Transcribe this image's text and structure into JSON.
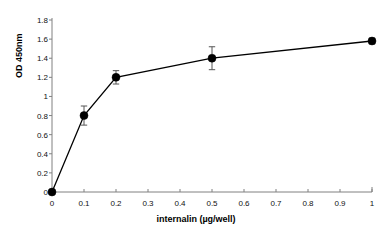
{
  "chart_data": {
    "type": "line",
    "title": "",
    "subtitle": "",
    "xlabel": "internalin (µg/well)",
    "ylabel": "OD 450nm",
    "xlim": [
      0,
      1
    ],
    "ylim": [
      0,
      1.8
    ],
    "grid": false,
    "legend": false,
    "legend_position": "none",
    "marker": "filled-circle",
    "line_color": "#000000",
    "marker_color": "#000000",
    "error_bar_color": "#555555",
    "axis_color": "#808080",
    "background_color": "#ffffff",
    "xticks": [
      0,
      0.1,
      0.2,
      0.3,
      0.4,
      0.5,
      0.6,
      0.7,
      0.8,
      0.9,
      1
    ],
    "xtick_labels": [
      "0",
      "0.1",
      "0.2",
      "0.3",
      "0.4",
      "0.5",
      "0.6",
      "0.7",
      "0.8",
      "0.9",
      "1"
    ],
    "yticks": [
      0,
      0.2,
      0.4,
      0.6,
      0.8,
      1,
      1.2,
      1.4,
      1.6,
      1.8
    ],
    "ytick_labels": [
      "0",
      "0.2",
      "0.4",
      "0.6",
      "0.8",
      "1",
      "1.2",
      "1.4",
      "1.6",
      "1.8"
    ],
    "x": [
      0,
      0.1,
      0.2,
      0.5,
      1
    ],
    "values": [
      0,
      0.8,
      1.2,
      1.4,
      1.58
    ],
    "yerr": [
      0,
      0.1,
      0.07,
      0.12,
      0.03
    ],
    "series": [
      {
        "name": "OD 450nm",
        "x": [
          0,
          0.1,
          0.2,
          0.5,
          1
        ],
        "values": [
          0,
          0.8,
          1.2,
          1.4,
          1.58
        ],
        "yerr": [
          0,
          0.1,
          0.07,
          0.12,
          0.03
        ]
      }
    ],
    "points": [
      {
        "x": 0,
        "y": 0,
        "yerr": 0,
        "xlabel": "0"
      },
      {
        "x": 0.1,
        "y": 0.8,
        "yerr": 0.1,
        "xlabel": "0.1"
      },
      {
        "x": 0.2,
        "y": 1.2,
        "yerr": 0.07,
        "xlabel": "0.2"
      },
      {
        "x": 0.5,
        "y": 1.4,
        "yerr": 0.12,
        "xlabel": "0.5"
      },
      {
        "x": 1,
        "y": 1.58,
        "yerr": 0.03,
        "xlabel": "1"
      }
    ]
  }
}
